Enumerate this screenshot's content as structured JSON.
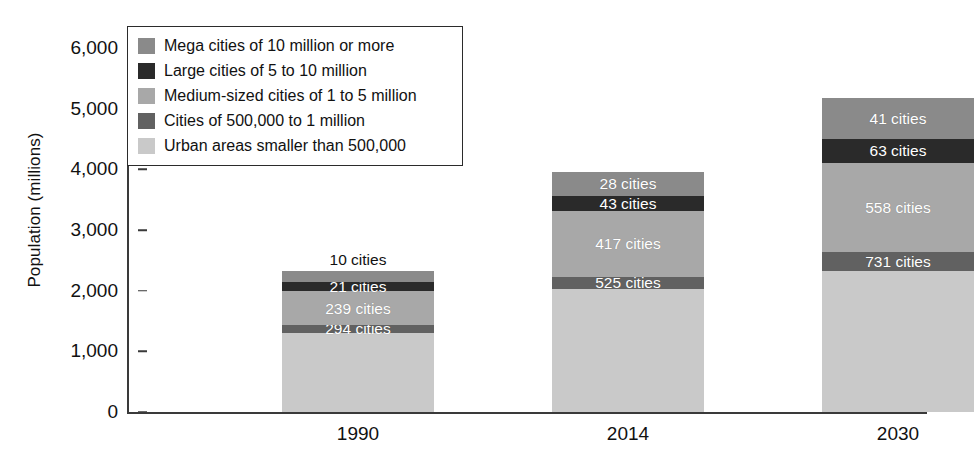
{
  "chart_data": {
    "type": "bar",
    "subtype": "stacked-bar",
    "title": "",
    "xlabel": "",
    "ylabel": "Population (millions)",
    "ylim": [
      0,
      6000
    ],
    "ytick_values": [
      0,
      1000,
      2000,
      3000,
      4000,
      5000,
      6000
    ],
    "ytick_labels": [
      "0",
      "1,000",
      "2,000",
      "3,000",
      "4,000",
      "5,000",
      "6,000"
    ],
    "grid": false,
    "legend_position": "upper-left-inside",
    "categories": [
      "1990",
      "2014",
      "2030"
    ],
    "series": [
      {
        "name": "Urban areas smaller than 500,000",
        "color": "#c9c9c9",
        "values": [
          1310,
          2020,
          2330
        ],
        "annotations": [
          "",
          "",
          ""
        ]
      },
      {
        "name": "Cities of 500,000 to 1 million",
        "color": "#616161",
        "values": [
          120,
          210,
          300
        ],
        "annotations": [
          "294 cities",
          "525 cities",
          "731 cities"
        ]
      },
      {
        "name": "Medium-sized cities of 1 to 5 million",
        "color": "#a8a8a8",
        "values": [
          560,
          1080,
          1480
        ],
        "annotations": [
          "239 cities",
          "417 cities",
          "558 cities"
        ]
      },
      {
        "name": "Large cities of 5 to 10 million",
        "color": "#2a2a2a",
        "values": [
          150,
          250,
          390
        ],
        "annotations": [
          "21 cities",
          "43 cities",
          "63 cities"
        ]
      },
      {
        "name": "Mega cities of 10 million or more",
        "color": "#8a8a8a",
        "values": [
          190,
          390,
          680
        ],
        "annotations": [
          "10 cities",
          "28 cities",
          "41 cities"
        ]
      }
    ],
    "totals": [
      2330,
      3950,
      5180
    ]
  },
  "legend": {
    "items": [
      {
        "label": "Mega cities of 10 million or more",
        "color": "#8a8a8a"
      },
      {
        "label": "Large cities of 5 to 10 million",
        "color": "#2a2a2a"
      },
      {
        "label": "Medium-sized cities of 1 to 5 million",
        "color": "#a8a8a8"
      },
      {
        "label": "Cities of 500,000 to 1 million",
        "color": "#616161"
      },
      {
        "label": "Urban areas smaller than 500,000",
        "color": "#c9c9c9"
      }
    ]
  }
}
